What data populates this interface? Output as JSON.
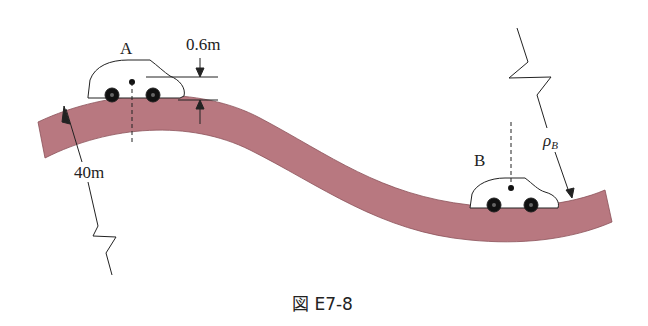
{
  "figure": {
    "caption": "図 E7-8",
    "road_color": "#b87880",
    "labels": {
      "point_a": "A",
      "point_b": "B",
      "height": "0.6m",
      "radius_a": "40m",
      "radius_b_symbol": "ρ",
      "radius_b_subscript": "B"
    }
  }
}
